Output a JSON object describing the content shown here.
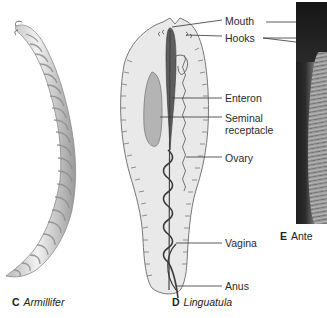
{
  "figure": {
    "panels": [
      {
        "id": "C",
        "letter": "C",
        "name": "Armillifer",
        "kind": "drawing"
      },
      {
        "id": "D",
        "letter": "D",
        "name": "Linguatula",
        "kind": "labeled-diagram",
        "labels": [
          {
            "text": "Mouth"
          },
          {
            "text": "Hooks"
          },
          {
            "text": "Enteron"
          },
          {
            "text": "Seminal"
          },
          {
            "text": "receptacle"
          },
          {
            "text": "Ovary"
          },
          {
            "text": "Vagina"
          },
          {
            "text": "Anus"
          }
        ]
      },
      {
        "id": "E",
        "letter": "E",
        "name": "Ante",
        "kind": "photo"
      }
    ]
  }
}
